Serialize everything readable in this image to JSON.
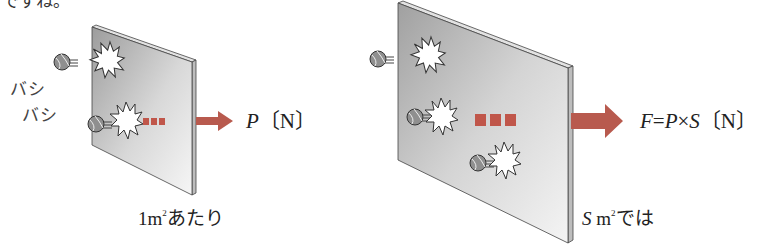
{
  "top_text_fragment": "ですね。",
  "onomatopoeia": [
    "バシ",
    "バシ"
  ],
  "left_panel": {
    "force_label": {
      "symbol": "P",
      "unit": "〔N〕"
    },
    "area_label": {
      "prefix": "1m",
      "sup": "2",
      "suffix": "あたり"
    }
  },
  "right_panel": {
    "force_label": {
      "lhs": "F",
      "eq": "=",
      "p": "P",
      "times": "×",
      "s": "S",
      "unit": "〔N〕"
    },
    "area_label": {
      "prefix": "S",
      "unit": " m",
      "sup": "2",
      "suffix": "では"
    }
  },
  "colors": {
    "arrow": "#b85a4e",
    "dots": "#c0564a",
    "plate_light": "#f2f2f2",
    "plate_dark": "#a9a9a9",
    "edge": "#444444"
  },
  "icons": [
    "ball-icon",
    "impact-burst-icon",
    "force-arrow-icon",
    "ellipsis-dots-icon"
  ]
}
